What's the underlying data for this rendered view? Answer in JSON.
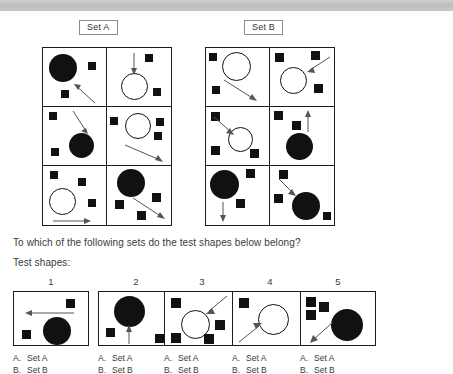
{
  "page": {
    "question": "To which of the following sets do the test shapes below belong?",
    "test_shapes_label": "Test shapes:"
  },
  "sets": {
    "a": {
      "label": "Set A"
    },
    "b": {
      "label": "Set B"
    }
  },
  "set_a_cells": [
    {
      "name": "set-a-cell-1",
      "description": "large filled black circle top-left, small square right, small square bottom-left, diagonal arrow pointing up-left toward circle"
    },
    {
      "name": "set-a-cell-2",
      "description": "open circle center, small square top-right, small square bottom-right, vertical arrow pointing down into circle"
    },
    {
      "name": "set-a-cell-3",
      "description": "filled black circle lower-center, squares top-left and bottom-left, diagonal arrow pointing down-right into circle"
    },
    {
      "name": "set-a-cell-4",
      "description": "open circle upper-center, squares left and right, diagonal arrow pointing down-right away"
    },
    {
      "name": "set-a-cell-5",
      "description": "open circle lower-left, three squares, horizontal arrow pointing right"
    },
    {
      "name": "set-a-cell-6",
      "description": "filled black circle top-left, squares, diagonal arrow pointing down-right away"
    }
  ],
  "set_b_cells": [
    {
      "name": "set-b-cell-1",
      "description": "open circle top-center, squares left and bottom-left, diagonal arrow pointing down-right away"
    },
    {
      "name": "set-b-cell-2",
      "description": "open circle center-left, two squares top, square bottom-right, diagonal arrow pointing down-left into circle"
    },
    {
      "name": "set-b-cell-3",
      "description": "open circle center, squares top-left bottom-left bottom-right, diagonal arrow pointing down-right into circle"
    },
    {
      "name": "set-b-cell-4",
      "description": "filled black circle center, squares top-left and center, vertical arrow pointing up away"
    },
    {
      "name": "set-b-cell-5",
      "description": "filled black circle top-left, square top-right, square center, vertical arrow pointing down away"
    },
    {
      "name": "set-b-cell-6",
      "description": "filled black circle lower-center, squares top-left and left, small square bottom-right, diagonal arrow pointing down-right into circle"
    }
  ],
  "test_shapes": [
    {
      "number": "1",
      "description": "square top-right, filled black circle bottom-center, square bottom-left, horizontal arrow pointing left",
      "options": [
        {
          "letter": "A.",
          "text": "Set A"
        },
        {
          "letter": "B.",
          "text": "Set B"
        }
      ]
    },
    {
      "number": "2",
      "description": "filled black circle top-center, square left, square bottom-right, vertical arrow pointing up into circle",
      "options": [
        {
          "letter": "A.",
          "text": "Set A"
        },
        {
          "letter": "B.",
          "text": "Set B"
        }
      ]
    },
    {
      "number": "3",
      "description": "open circle center, four squares around, diagonal arrow pointing down-left into circle",
      "options": [
        {
          "letter": "A.",
          "text": "Set A"
        },
        {
          "letter": "B.",
          "text": "Set B"
        }
      ]
    },
    {
      "number": "4",
      "description": "open circle center-right, square top-left, diagonal arrow pointing up-right into circle",
      "options": [
        {
          "letter": "A.",
          "text": "Set A"
        },
        {
          "letter": "B.",
          "text": "Set B"
        }
      ]
    },
    {
      "number": "5",
      "description": "three squares top-left, filled black circle center-right, diagonal arrow pointing down-left away",
      "options": [
        {
          "letter": "A.",
          "text": "Set A"
        },
        {
          "letter": "B.",
          "text": "Set B"
        }
      ]
    }
  ],
  "colors": {
    "shape_fill": "#111111",
    "outline": "#1d1d1d",
    "text": "#3a3a3a",
    "band": "#c4c4c4"
  }
}
